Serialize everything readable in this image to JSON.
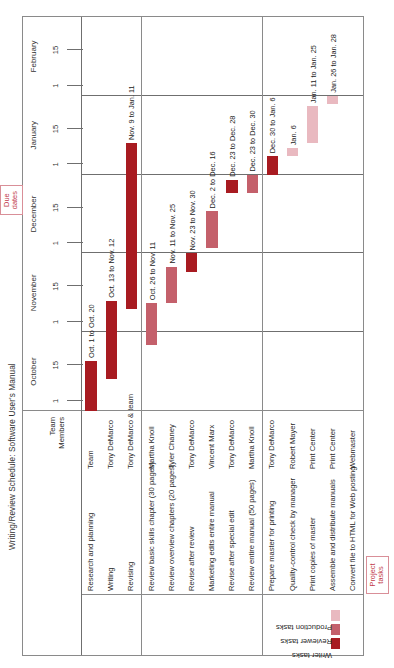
{
  "chart_data": {
    "type": "bar",
    "subtype": "gantt",
    "title": "Writing/Review Schedule: Software User's Manual",
    "xlabel": "",
    "ylabel": "",
    "grid": true,
    "axis": {
      "months": [
        {
          "name": "October",
          "ticks": [
            "1",
            "15"
          ]
        },
        {
          "name": "November",
          "ticks": [
            "1",
            "15"
          ]
        },
        {
          "name": "December",
          "ticks": [
            "1",
            "15"
          ]
        },
        {
          "name": "January",
          "ticks": [
            "1",
            "15"
          ]
        },
        {
          "name": "February",
          "ticks": [
            "1",
            "15"
          ]
        }
      ],
      "range_start": "Oct 1",
      "range_end": "Feb 28"
    },
    "columns": [
      "Project tasks",
      "Team Members",
      "Due dates"
    ],
    "categories": [
      "Research and planning",
      "Writing",
      "Revising",
      "Review basic skills chapter (30 pages)",
      "Review overview chapters (20 pages)",
      "Revise after review",
      "Marketing edits entire manual",
      "Revise after special edit",
      "Review entire manual (50 pages)",
      "Prepare master for printing",
      "Quality-control check by manager",
      "Print copies of master",
      "Assemble and distribute manuals",
      "Convert file to HTML for Web posting"
    ],
    "series": [
      {
        "name": "Writer tasks",
        "color": "#a81b21"
      },
      {
        "name": "Reviewer tasks",
        "color": "#c4606b"
      },
      {
        "name": "Production tasks",
        "color": "#e9b9c0"
      }
    ]
  },
  "header": {
    "title": "Writing/Review Schedule: Software User's Manual"
  },
  "legend": {
    "items": [
      {
        "label": "Writer tasks",
        "color": "#a81b21"
      },
      {
        "label": "Reviewer tasks",
        "color": "#c4606b"
      },
      {
        "label": "Production tasks",
        "color": "#e9b9c0"
      }
    ]
  },
  "columns": {
    "team_header_line1": "Team",
    "team_header_line2": "Members"
  },
  "callouts": {
    "due_dates": "Due\ndates",
    "project_tasks": "Project\ntasks"
  },
  "groups": [
    {
      "name": "Writer tasks",
      "rows": [
        {
          "task": "Research and planning",
          "member": "Team",
          "bar_label": "Oct. 1 to Oct. 20",
          "kind": "writer",
          "start_day": 0,
          "end_day": 19
        },
        {
          "task": "Writing",
          "member": "Tony DeMarco",
          "bar_label": "Oct. 13 to Nov. 12",
          "kind": "writer",
          "start_day": 12,
          "end_day": 42
        },
        {
          "task": "Revising",
          "member": "Tony DeMarco & team",
          "bar_label": "Nov. 9 to Jan. 11",
          "kind": "writer",
          "start_day": 39,
          "end_day": 102
        }
      ]
    },
    {
      "name": "Reviewer tasks",
      "rows": [
        {
          "task": "Review basic skills chapter (30 pages)",
          "member": "Martha Knoll",
          "bar_label": "Oct. 26 to Nov. 11",
          "kind": "reviewer",
          "start_day": 25,
          "end_day": 41
        },
        {
          "task": "Review overview chapters (20 pages)",
          "member": "Tyler Chaney",
          "bar_label": "Nov. 11 to Nov. 25",
          "kind": "reviewer",
          "start_day": 41,
          "end_day": 55
        },
        {
          "task": "Revise after review",
          "member": "Tony DeMarco",
          "bar_label": "Nov. 23 to Nov. 30",
          "kind": "writer",
          "start_day": 53,
          "end_day": 60
        },
        {
          "task": "Marketing edits entire manual",
          "member": "Vincent Marx",
          "bar_label": "Dec. 2 to Dec. 16",
          "kind": "reviewer",
          "start_day": 62,
          "end_day": 76
        },
        {
          "task": "Revise after special edit",
          "member": "Tony DeMarco",
          "bar_label": "Dec. 23 to Dec. 28",
          "kind": "writer",
          "start_day": 83,
          "end_day": 88
        },
        {
          "task": "Review entire manual (50 pages)",
          "member": "Martha Knoll",
          "bar_label": "Dec. 23 to Dec. 30",
          "kind": "reviewer",
          "start_day": 83,
          "end_day": 90
        }
      ]
    },
    {
      "name": "Production tasks",
      "rows": [
        {
          "task": "Prepare master for printing",
          "member": "Tony DeMarco",
          "bar_label": "Dec. 30 to Jan. 6",
          "kind": "writer",
          "start_day": 90,
          "end_day": 97
        },
        {
          "task": "Quality-control check by manager",
          "member": "Robert Mayer",
          "bar_label": "Jan. 6",
          "kind": "production",
          "start_day": 97,
          "end_day": 100
        },
        {
          "task": "Print copies of master",
          "member": "Print Center",
          "bar_label": "Jan. 11 to Jan. 25",
          "kind": "production",
          "start_day": 102,
          "end_day": 116
        },
        {
          "task": "Assemble and distribute manuals",
          "member": "Print Center",
          "bar_label": "Jan. 26 to Jan. 28",
          "kind": "production",
          "start_day": 117,
          "end_day": 120
        },
        {
          "task": "Convert file to HTML for Web posting",
          "member": "Webmaster",
          "bar_label": "",
          "kind": "production",
          "start_day": null,
          "end_day": null
        }
      ]
    }
  ]
}
